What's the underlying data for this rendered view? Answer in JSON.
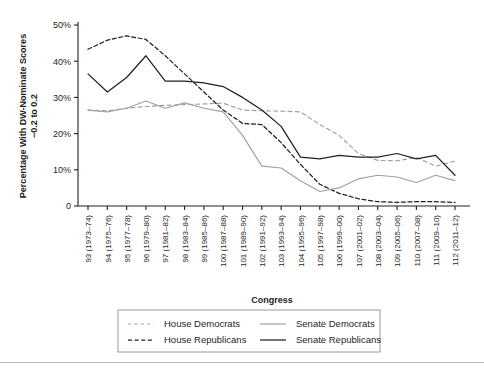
{
  "chart_data": {
    "type": "line",
    "title": "",
    "xlabel": "Congress",
    "ylabel": "Percentage With DW-Nominate Scores −0.2 to 0.2",
    "ylabel_line1": "Percentage With DW-Nominate Scores",
    "ylabel_line2": "−0.2 to 0.2",
    "ylim": [
      0,
      50
    ],
    "yticks": [
      0,
      10,
      20,
      30,
      40,
      50
    ],
    "ytick_labels": [
      "0",
      "10%",
      "20%",
      "30%",
      "40%",
      "50%"
    ],
    "grid": false,
    "legend_position": "bottom",
    "categories": [
      "93 (1973–74)",
      "94 (1975–76)",
      "95 (1977–78)",
      "96 (1979–80)",
      "97 (1981–82)",
      "98 (1983–84)",
      "99 (1985–86)",
      "100 (1987–88)",
      "101 (1989–90)",
      "102 (1991–92)",
      "103 (1993–94)",
      "104 (1995–96)",
      "105 (1997–98)",
      "106 (1999–00)",
      "107 (2001–02)",
      "108 (2003–04)",
      "109 (2005–06)",
      "110 (2007–08)",
      "111 (2009–10)",
      "112 (2011–12)"
    ],
    "series": [
      {
        "name": "House Democrats",
        "style": "dashed",
        "color": "#a0a0a0",
        "values": [
          26.5,
          26.3,
          27.0,
          27.5,
          27.8,
          28.0,
          28.2,
          28.4,
          26.5,
          26.3,
          26.2,
          26.0,
          22.5,
          19.5,
          14.5,
          12.6,
          12.5,
          13.4,
          11.0,
          12.4
        ]
      },
      {
        "name": "House Republicans",
        "style": "dashed",
        "color": "#231f20",
        "values": [
          43.3,
          45.8,
          47.0,
          46.0,
          41.5,
          36.5,
          31.5,
          26.5,
          22.8,
          22.5,
          17.5,
          11.5,
          6.0,
          3.5,
          2.0,
          1.2,
          1.0,
          1.2,
          1.2,
          1.0
        ]
      },
      {
        "name": "Senate Democrats",
        "style": "solid",
        "color": "#a0a0a0",
        "values": [
          26.5,
          26.0,
          27.0,
          29.0,
          27.0,
          28.5,
          27.0,
          26.0,
          19.5,
          11.0,
          10.5,
          7.0,
          4.0,
          5.0,
          7.5,
          8.5,
          8.0,
          6.5,
          8.5,
          7.0
        ]
      },
      {
        "name": "Senate Republicans",
        "style": "solid",
        "color": "#231f20",
        "values": [
          36.5,
          31.5,
          35.5,
          41.5,
          34.5,
          34.5,
          34.0,
          33.0,
          30.0,
          26.5,
          22.0,
          13.5,
          13.0,
          14.0,
          13.5,
          13.5,
          14.5,
          13.0,
          14.0,
          8.5
        ]
      }
    ]
  },
  "legend": {
    "items": [
      {
        "label": "House Democrats",
        "style": "dashed",
        "color": "#a0a0a0"
      },
      {
        "label": "House Republicans",
        "style": "dashed",
        "color": "#231f20"
      },
      {
        "label": "Senate Democrats",
        "style": "solid",
        "color": "#a0a0a0"
      },
      {
        "label": "Senate Republicans",
        "style": "solid",
        "color": "#231f20"
      }
    ]
  },
  "colors": {
    "dark": "#231f20",
    "light": "#a0a0a0",
    "axis": "#231f20",
    "legend_border": "#9a9a9a",
    "rule": "#b9b9b9"
  }
}
